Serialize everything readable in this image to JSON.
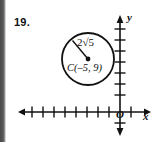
{
  "problem": {
    "number": "19."
  },
  "figure": {
    "type": "coordinate-plane-circle-diagram",
    "axes": {
      "x_label": "x",
      "y_label": "y",
      "origin_label": "O",
      "x_axis_y_px": 112,
      "y_axis_x_px": 120,
      "x_tick_count": 9,
      "y_tick_count": 8,
      "tick_spacing_px": 11
    },
    "circle": {
      "center_label": "C(–5, 9)",
      "radius_label": "2√5",
      "center_px": {
        "x": 88,
        "y": 59
      },
      "radius_px": 26
    },
    "radius_segment": {
      "from_px": {
        "x": 88,
        "y": 59
      },
      "to_px": {
        "x": 72,
        "y": 40
      }
    },
    "colors": {
      "ink": "#111111",
      "paper": "#ffffff",
      "page_edge": "#4a4a4a"
    }
  }
}
